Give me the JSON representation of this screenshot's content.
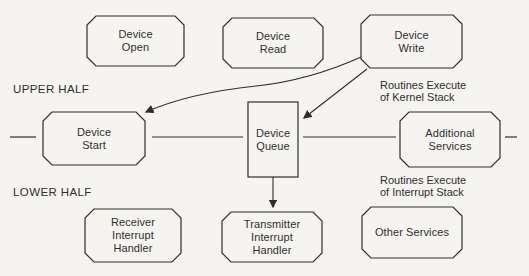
{
  "diagram": {
    "section_labels": {
      "upper": "UPPER HALF",
      "lower": "LOWER HALF"
    },
    "annotations": {
      "kernel_line1": "Routines Execute",
      "kernel_line2": "of Kernel Stack",
      "interrupt_line1": "Routines Execute",
      "interrupt_line2": "of Interrupt Stack"
    },
    "nodes": {
      "device_open": {
        "line1": "Device",
        "line2": "Open"
      },
      "device_read": {
        "line1": "Device",
        "line2": "Read"
      },
      "device_write": {
        "line1": "Device",
        "line2": "Write"
      },
      "device_start": {
        "line1": "Device",
        "line2": "Start"
      },
      "device_queue": {
        "line1": "Device",
        "line2": "Queue"
      },
      "additional_services": {
        "line1": "Additional",
        "line2": "Services"
      },
      "receiver_interrupt_handler": {
        "line1": "Receiver",
        "line2": "Interrupt",
        "line3": "Handler"
      },
      "transmitter_interrupt_handler": {
        "line1": "Transmitter",
        "line2": "Interrupt",
        "line3": "Handler"
      },
      "other_services": {
        "line1": "Other Services"
      }
    },
    "colors": {
      "line": "#2f2e2c",
      "text": "#302f2d",
      "background": "#f5f4f1"
    }
  }
}
